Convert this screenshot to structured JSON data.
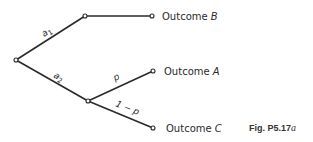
{
  "figure": {
    "caption_prefix": "Fig. P5.17",
    "caption_suffix": "a"
  },
  "tree": {
    "root": {
      "x": 16,
      "y": 60
    },
    "branches": [
      {
        "label": "a",
        "subscript": "1",
        "from": "root",
        "to": "node_a1"
      },
      {
        "label": "a",
        "subscript": "2",
        "from": "root",
        "to": "node_a2"
      },
      {
        "label": "p",
        "from": "node_a2",
        "to": "outcome_A"
      },
      {
        "label": "1 − p",
        "from": "node_a2",
        "to": "outcome_C"
      }
    ],
    "outcomes": [
      {
        "prefix": "Outcome",
        "letter": "B"
      },
      {
        "prefix": "Outcome",
        "letter": "A"
      },
      {
        "prefix": "Outcome",
        "letter": "C"
      }
    ]
  }
}
